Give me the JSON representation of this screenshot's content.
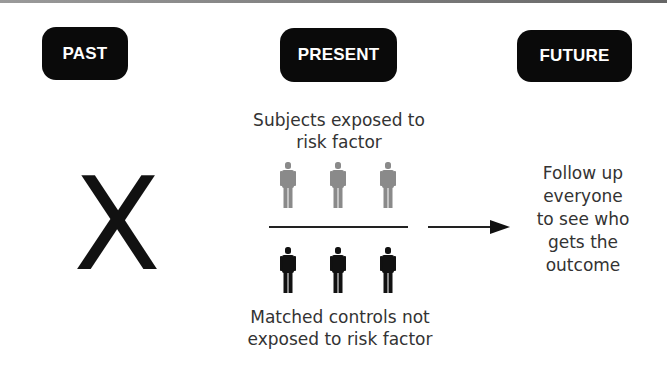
{
  "timeline": {
    "past": "PAST",
    "present": "PRESENT",
    "future": "FUTURE"
  },
  "past_marker": {
    "symbol": "X",
    "icon": "x-mark-icon"
  },
  "present": {
    "exposed_group": {
      "label": "Subjects exposed to\nrisk factor",
      "figure_count": 3,
      "figure_color": "#8a8a8a",
      "icon": "person-icon"
    },
    "control_group": {
      "label": "Matched controls not\nexposed to risk factor",
      "figure_count": 3,
      "figure_color": "#111111",
      "icon": "person-icon"
    }
  },
  "future": {
    "label": "Follow up\neveryone\nto see who\ngets the\noutcome",
    "arrow_icon": "right-arrow-icon"
  },
  "colors": {
    "badge_bg": "#0a0a0a",
    "badge_text": "#ffffff",
    "text": "#333333",
    "exposed_figure": "#8a8a8a",
    "control_figure": "#111111"
  }
}
